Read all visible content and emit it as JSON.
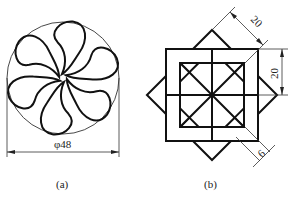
{
  "figure_a": {
    "caption": "(a)",
    "dimension_label": "φ48",
    "description": "Six-lobed pinwheel of kidney-shaped petals inscribed in a circle",
    "petal_count": 6,
    "circle": {
      "cx": 63,
      "cy": 78,
      "r": 56
    }
  },
  "figure_b": {
    "caption": "(b)",
    "description": "Interlaced eight-arm square star made of L-shaped bands",
    "dimensions": {
      "diagonal_side": "20",
      "vertical_side": "20",
      "band_width": "6"
    },
    "center": {
      "x": 212,
      "y": 95
    },
    "quadrant_size_px": 46,
    "band_px": 14
  },
  "colors": {
    "line": "#111111",
    "thin_line": "#333333",
    "background": "#ffffff"
  }
}
